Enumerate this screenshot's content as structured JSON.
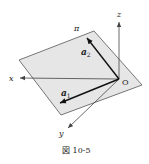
{
  "figure": {
    "caption": "図 10-5",
    "plane_label": "π",
    "axes": {
      "x_label": "x",
      "y_label": "y",
      "z_label": "z",
      "origin_label": "O"
    },
    "vectors": {
      "a1_label": "a",
      "a1_sub": "1",
      "a2_label": "a",
      "a2_sub": "2"
    },
    "colors": {
      "plane_fill": "#e6e6e6",
      "plane_edge": "#555555",
      "axis": "#444444",
      "vector": "#111111"
    }
  }
}
